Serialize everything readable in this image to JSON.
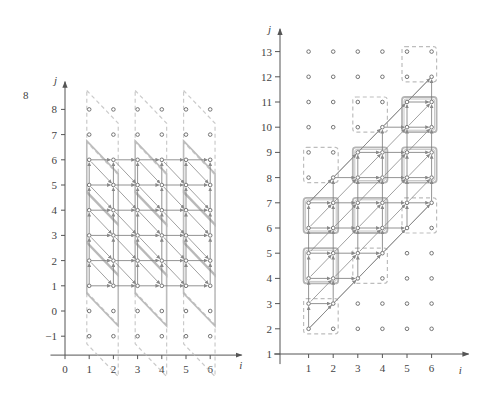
{
  "corner_label": "8",
  "colors": {
    "axis": "#555555",
    "point": "#666666",
    "arrow": "#777777",
    "tile_solid": "#b5b5b5",
    "tile_dashed": "#bdbdbd",
    "diagonal": "#888888"
  },
  "left_plot": {
    "x_label": "i",
    "y_label": "j",
    "x_ticks": [
      0,
      1,
      2,
      3,
      4,
      5,
      6
    ],
    "y_ticks": [
      -1,
      0,
      1,
      2,
      3,
      4,
      5,
      6,
      7,
      8
    ],
    "origin_px": [
      65,
      311
    ],
    "dx": 24.2,
    "dy": 25.2,
    "points_i": [
      1,
      6
    ],
    "points_j": [
      -1,
      8
    ],
    "active_j": [
      1,
      6
    ],
    "tile_columns": [
      {
        "i0": 1,
        "i1": 2.2
      },
      {
        "i0": 3,
        "i1": 4.2
      },
      {
        "i0": 5,
        "i1": 6.2
      }
    ],
    "tiles_j_start": [
      -1,
      1,
      3,
      5,
      7
    ],
    "dependence": "uniform (1,0),(0,1),(1,-1)"
  },
  "right_plot": {
    "x_label": "i",
    "y_label": "j",
    "x_ticks": [
      1,
      2,
      3,
      4,
      5,
      6
    ],
    "y_ticks": [
      1,
      2,
      3,
      4,
      5,
      6,
      7,
      8,
      9,
      10,
      11,
      12,
      13
    ],
    "origin_px": [
      284,
      354
    ],
    "dx": 24.6,
    "dy": 25.2,
    "points_i": [
      1,
      6
    ],
    "points_j": [
      2,
      13
    ],
    "tiles": [
      {
        "i": 1,
        "j": 2,
        "style": "dashed"
      },
      {
        "i": 1,
        "j": 4,
        "style": "solid"
      },
      {
        "i": 1,
        "j": 6,
        "style": "solid"
      },
      {
        "i": 1,
        "j": 8,
        "style": "dashed"
      },
      {
        "i": 3,
        "j": 4,
        "style": "dashed"
      },
      {
        "i": 3,
        "j": 6,
        "style": "solid"
      },
      {
        "i": 3,
        "j": 8,
        "style": "solid"
      },
      {
        "i": 3,
        "j": 10,
        "style": "dashed"
      },
      {
        "i": 5,
        "j": 6,
        "style": "dashed"
      },
      {
        "i": 5,
        "j": 8,
        "style": "solid"
      },
      {
        "i": 5,
        "j": 10,
        "style": "solid"
      },
      {
        "i": 5,
        "j": 12,
        "style": "dashed"
      }
    ],
    "active_region": "j >= i + 1 and j <= i + 6",
    "dependence": "uniform (1,0),(0,1),(1,1)"
  }
}
